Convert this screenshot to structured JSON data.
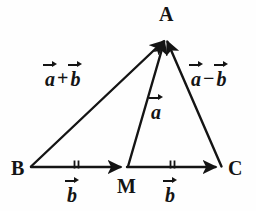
{
  "figure": {
    "background_color": "#fefefe",
    "stroke_color": "#141414"
  },
  "vertices": [
    {
      "id": "A",
      "label": "A",
      "x": 165,
      "y": 37
    },
    {
      "id": "B",
      "label": "B",
      "x": 30,
      "y": 167
    },
    {
      "id": "M",
      "label": "M",
      "x": 127,
      "y": 167
    },
    {
      "id": "C",
      "label": "C",
      "x": 222,
      "y": 167
    }
  ],
  "vertex_labels": {
    "A": "A",
    "B": "B",
    "M": "M",
    "C": "C"
  },
  "vector_labels": {
    "sum": {
      "first": "a",
      "operator": "+",
      "second": "b",
      "text": "a+b"
    },
    "median": {
      "first": "a",
      "operator": "",
      "second": "",
      "text": "a"
    },
    "difference": {
      "first": "a",
      "operator": "−",
      "second": "b",
      "text": "a−b"
    },
    "segment_bm": {
      "first": "b",
      "operator": "",
      "second": "",
      "text": "b"
    },
    "segment_mc": {
      "first": "b",
      "operator": "",
      "second": "",
      "text": "b"
    }
  },
  "arrows": [
    {
      "name": "vector-ba",
      "from": "B",
      "to": "A",
      "label": "a+b"
    },
    {
      "name": "vector-ma",
      "from": "M",
      "to": "A",
      "label": "a"
    },
    {
      "name": "vector-ca",
      "from": "C",
      "to": "A",
      "label": "a−b"
    },
    {
      "name": "vector-bm",
      "from": "B",
      "to": "M",
      "label": "b"
    },
    {
      "name": "vector-mc",
      "from": "M",
      "to": "C",
      "label": "b"
    }
  ],
  "tick_marks": [
    {
      "name": "congruence-ticks-bm",
      "on_segment": "BM",
      "count": 2
    },
    {
      "name": "congruence-ticks-mc",
      "on_segment": "MC",
      "count": 2
    }
  ]
}
